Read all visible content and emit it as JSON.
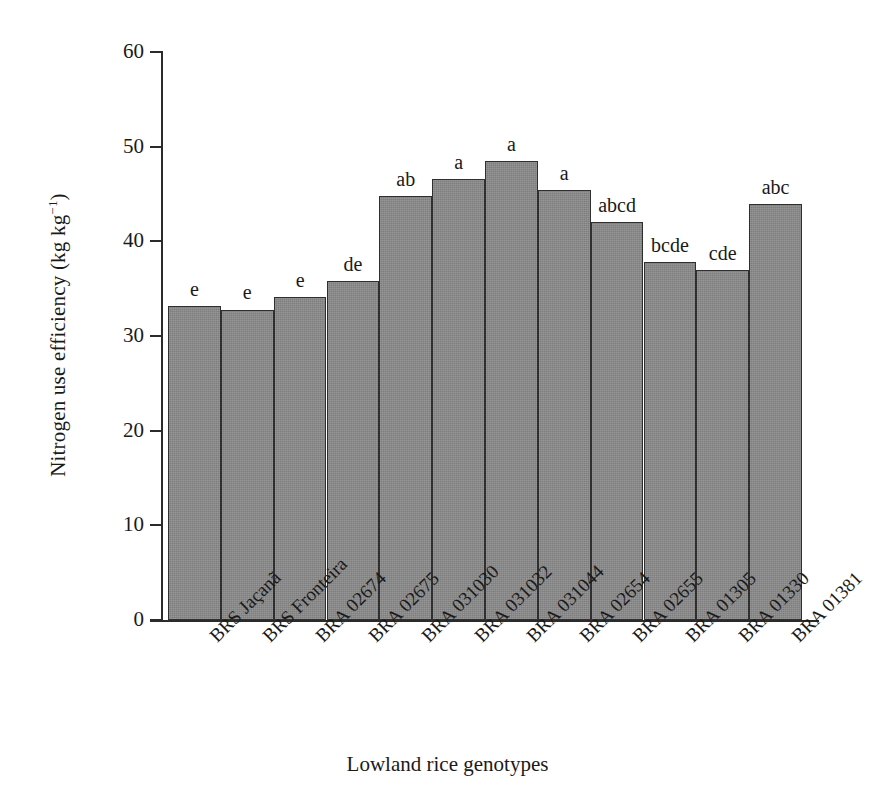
{
  "chart_data": {
    "type": "bar",
    "title": "",
    "xlabel": "Lowland rice genotypes",
    "ylabel": "Nitrogen use efficiency (kg kg⁻¹)",
    "ylabel_main": "Nitrogen use efficiency (kg kg",
    "ylabel_sup": "−1",
    "ylabel_tail": ")",
    "ylim": [
      0,
      60
    ],
    "ytick_labels": [
      "0",
      "10",
      "20",
      "30",
      "40",
      "50",
      "60"
    ],
    "ytick_values": [
      0,
      10,
      20,
      30,
      40,
      50,
      60
    ],
    "grid": false,
    "legend": "none",
    "bar_color": "#8b8b8b",
    "bar_edge_color": "#2f2f2f",
    "axis_color": "#2b2b2b",
    "categories": [
      "BRS Jaçanã",
      "BRS Fronteira",
      "BRA 02674",
      "BRA 02675",
      "BRA 031030",
      "BRA 031032",
      "BRA 031044",
      "BRA 02654",
      "BRA 02655",
      "BRA 01305",
      "BRA 01330",
      "BRA 01381"
    ],
    "values": [
      33.2,
      32.8,
      34.1,
      35.8,
      44.8,
      46.6,
      48.5,
      45.4,
      42.0,
      37.8,
      37.0,
      43.9
    ],
    "annotations": [
      "e",
      "e",
      "e",
      "de",
      "ab",
      "a",
      "a",
      "a",
      "abcd",
      "bcde",
      "cde",
      "abc"
    ],
    "annotation_note": "Letters denote statistical significance groupings (Tukey test)"
  }
}
